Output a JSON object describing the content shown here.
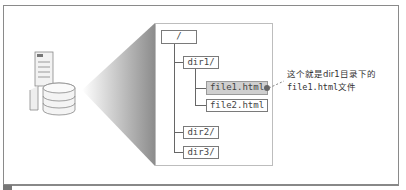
{
  "diagram": {
    "type": "directory-tree",
    "server_icon": "server-with-database-icon",
    "tree": {
      "root": "/",
      "children": [
        {
          "label": "dir1/",
          "children": [
            {
              "label": "file1.html",
              "highlighted": true
            },
            {
              "label": "file2.html"
            }
          ]
        },
        {
          "label": "dir2/"
        },
        {
          "label": "dir3/"
        }
      ]
    },
    "annotation": {
      "line1": "这个就是dir1目录下的",
      "line2": "file1.html文件"
    },
    "colors": {
      "highlight": "#cfcfcf",
      "border": "#7a7a7a",
      "line": "#666666"
    }
  }
}
